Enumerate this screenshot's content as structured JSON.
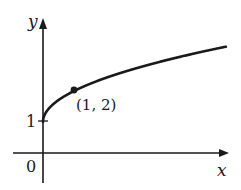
{
  "chart_data": {
    "type": "line",
    "title": "",
    "xlabel": "x",
    "ylabel": "y",
    "function": "y = 1 + sqrt(x)",
    "x": [
      0,
      0.25,
      0.5,
      1,
      2,
      3,
      4,
      5,
      5.9
    ],
    "values": [
      1,
      1.5,
      1.707,
      2,
      2.414,
      2.732,
      3,
      3.236,
      3.429
    ],
    "ticks": {
      "x": [
        "0"
      ],
      "y": [
        "1"
      ]
    },
    "annotations": [
      {
        "type": "point",
        "x": 1,
        "y": 2,
        "label": "(1, 2)"
      }
    ],
    "origin_label": "0",
    "grid": false,
    "legend": null
  },
  "labels": {
    "x_axis": "x",
    "y_axis": "y",
    "origin": "0",
    "y_tick_1": "1",
    "point": "(1, 2)"
  },
  "colors": {
    "stroke": "#1a1a1a",
    "background": "#ffffff"
  }
}
